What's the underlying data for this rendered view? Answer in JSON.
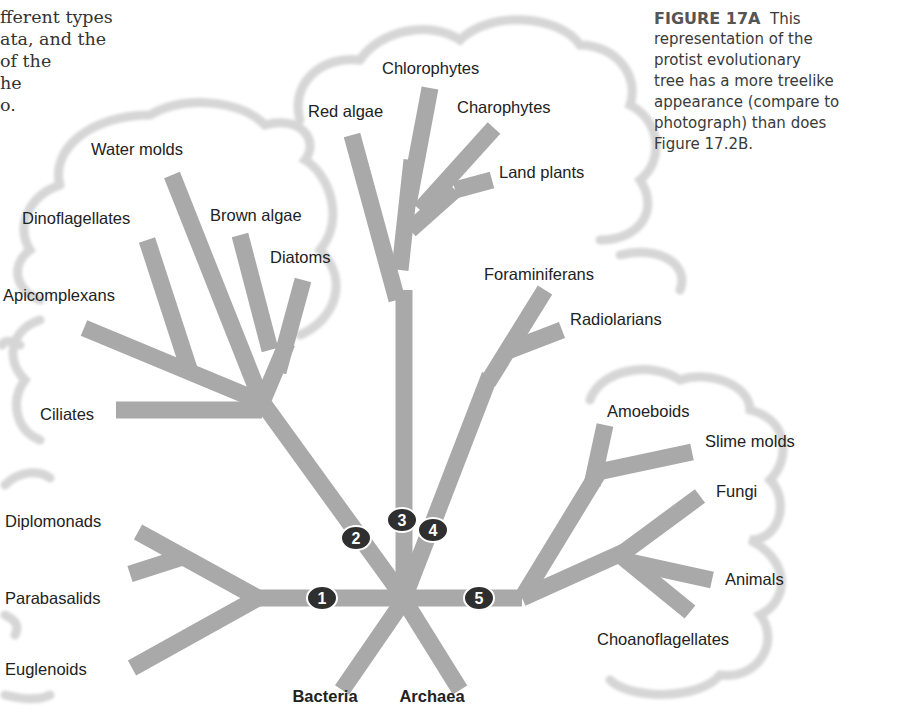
{
  "body_text": {
    "lines": [
      "fferent types",
      "ata, and the",
      "of the",
      "he",
      "o."
    ]
  },
  "caption": {
    "figure_label": "FIGURE 17A",
    "lines": [
      "This",
      "representation of the",
      "protist evolutionary",
      "tree has a more treelike",
      "appearance (compare to",
      "photograph) than does",
      "Figure 17.2B."
    ]
  },
  "colors": {
    "branch": "#a8a8a8",
    "cloud": "#d9d9d9",
    "marker": "#2f2f2f",
    "marker_text": "#ffffff",
    "label": "#222222"
  },
  "tree": {
    "roots": [
      {
        "label": "Bacteria",
        "x": 325,
        "y": 702
      },
      {
        "label": "Archaea",
        "x": 432,
        "y": 702
      }
    ],
    "taxa": [
      {
        "label": "Diplomonads",
        "x": 5,
        "y": 527,
        "anchor": "start"
      },
      {
        "label": "Parabasalids",
        "x": 5,
        "y": 604,
        "anchor": "start"
      },
      {
        "label": "Euglenoids",
        "x": 5,
        "y": 675,
        "anchor": "start"
      },
      {
        "label": "Ciliates",
        "x": 40,
        "y": 420,
        "anchor": "start"
      },
      {
        "label": "Apicomplexans",
        "x": 3,
        "y": 301,
        "anchor": "start"
      },
      {
        "label": "Dinoflagellates",
        "x": 22,
        "y": 224,
        "anchor": "start"
      },
      {
        "label": "Water molds",
        "x": 91,
        "y": 155,
        "anchor": "start"
      },
      {
        "label": "Brown algae",
        "x": 210,
        "y": 221,
        "anchor": "start"
      },
      {
        "label": "Diatoms",
        "x": 270,
        "y": 263,
        "anchor": "start"
      },
      {
        "label": "Red algae",
        "x": 308,
        "y": 117,
        "anchor": "start"
      },
      {
        "label": "Chlorophytes",
        "x": 382,
        "y": 74,
        "anchor": "start"
      },
      {
        "label": "Charophytes",
        "x": 457,
        "y": 113,
        "anchor": "start"
      },
      {
        "label": "Land plants",
        "x": 499,
        "y": 178,
        "anchor": "start"
      },
      {
        "label": "Foraminiferans",
        "x": 484,
        "y": 280,
        "anchor": "start"
      },
      {
        "label": "Radiolarians",
        "x": 570,
        "y": 325,
        "anchor": "start"
      },
      {
        "label": "Amoeboids",
        "x": 607,
        "y": 417,
        "anchor": "start"
      },
      {
        "label": "Slime molds",
        "x": 705,
        "y": 447,
        "anchor": "start"
      },
      {
        "label": "Fungi",
        "x": 716,
        "y": 497,
        "anchor": "start"
      },
      {
        "label": "Animals",
        "x": 725,
        "y": 585,
        "anchor": "start"
      },
      {
        "label": "Choanoflagellates",
        "x": 597,
        "y": 645,
        "anchor": "start"
      }
    ],
    "markers": [
      {
        "number": "1",
        "x": 322,
        "y": 598
      },
      {
        "number": "2",
        "x": 356,
        "y": 538
      },
      {
        "number": "3",
        "x": 402,
        "y": 520
      },
      {
        "number": "4",
        "x": 433,
        "y": 530
      },
      {
        "number": "5",
        "x": 479,
        "y": 598
      }
    ]
  }
}
